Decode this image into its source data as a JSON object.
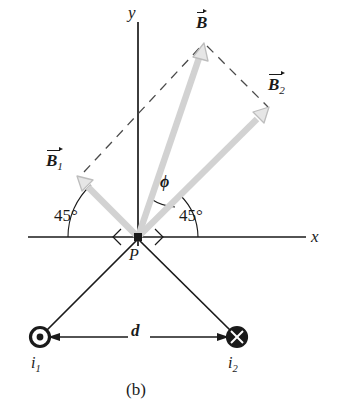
{
  "figure": {
    "caption": "(b)",
    "point_label": "P",
    "axis_x_label": "x",
    "axis_y_label": "y",
    "distance_label": "d",
    "angle_phi_label": "ϕ",
    "angle_left_label": "45°",
    "angle_right_label": "45°",
    "current_left": {
      "symbol": "i",
      "subscript": "1",
      "direction": "out-of-page"
    },
    "current_right": {
      "symbol": "i",
      "subscript": "2",
      "direction": "into-page"
    },
    "vectors": [
      {
        "name": "B1",
        "symbol": "B",
        "subscript": "1",
        "style": "solid-gray"
      },
      {
        "name": "B2",
        "symbol": "B",
        "subscript": "2",
        "style": "solid-gray"
      },
      {
        "name": "B",
        "symbol": "B",
        "subscript": "",
        "style": "solid-gray"
      }
    ],
    "colors": {
      "vector_gray": "#d2d2d2",
      "vector_outline": "#b4b4b4",
      "axis_black": "#1a1a1a",
      "dashed_gray": "#4a4a4a",
      "background": "#ffffff"
    }
  }
}
